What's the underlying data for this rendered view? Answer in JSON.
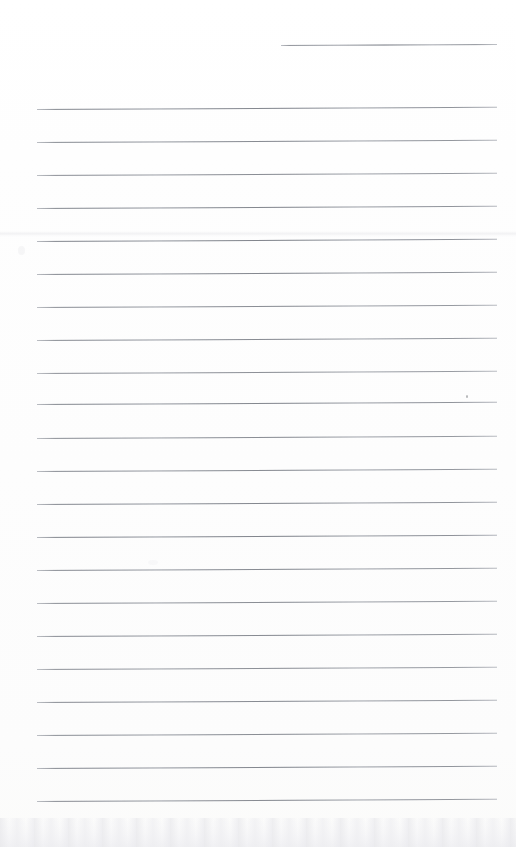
{
  "document": {
    "type": "scanned-blank-lined-page",
    "title": "Blank ruled notebook page",
    "page_width": 516,
    "page_height": 847,
    "background_color": "#fefefe",
    "rule_color": "#b9bcc2",
    "ink_color": "#787a80",
    "text_content": "",
    "has_handwriting": false,
    "has_printed_text": false,
    "rule_count": 24,
    "rule_spacing_px": 33.5,
    "rule_left_margin_px": 37,
    "rule_right_margin_px": 497,
    "skew_degrees": -0.28
  },
  "rules": [
    {
      "index": 1,
      "y": 45,
      "x1": 281,
      "x2": 497,
      "partial": true,
      "weight": 0.85
    },
    {
      "index": 2,
      "y": 109,
      "x1": 37,
      "x2": 497,
      "partial": false,
      "weight": 0.9
    },
    {
      "index": 3,
      "y": 142,
      "x1": 37,
      "x2": 497,
      "partial": false,
      "weight": 0.88
    },
    {
      "index": 4,
      "y": 175,
      "x1": 37,
      "x2": 497,
      "partial": false,
      "weight": 0.86
    },
    {
      "index": 5,
      "y": 208,
      "x1": 37,
      "x2": 497,
      "partial": false,
      "weight": 0.9
    },
    {
      "index": 6,
      "y": 241,
      "x1": 37,
      "x2": 497,
      "partial": false,
      "weight": 0.92
    },
    {
      "index": 7,
      "y": 274,
      "x1": 37,
      "x2": 497,
      "partial": false,
      "weight": 0.9
    },
    {
      "index": 8,
      "y": 307,
      "x1": 37,
      "x2": 497,
      "partial": false,
      "weight": 0.86
    },
    {
      "index": 9,
      "y": 340,
      "x1": 37,
      "x2": 497,
      "partial": false,
      "weight": 0.88
    },
    {
      "index": 10,
      "y": 373,
      "x1": 37,
      "x2": 497,
      "partial": false,
      "weight": 0.84
    },
    {
      "index": 11,
      "y": 404,
      "x1": 37,
      "x2": 497,
      "partial": false,
      "weight": 0.9
    },
    {
      "index": 12,
      "y": 438,
      "x1": 37,
      "x2": 497,
      "partial": false,
      "weight": 0.86
    },
    {
      "index": 13,
      "y": 471,
      "x1": 37,
      "x2": 497,
      "partial": false,
      "weight": 0.88
    },
    {
      "index": 14,
      "y": 504,
      "x1": 37,
      "x2": 497,
      "partial": false,
      "weight": 0.9
    },
    {
      "index": 15,
      "y": 537,
      "x1": 37,
      "x2": 497,
      "partial": false,
      "weight": 0.92
    },
    {
      "index": 16,
      "y": 570,
      "x1": 37,
      "x2": 497,
      "partial": false,
      "weight": 0.88
    },
    {
      "index": 17,
      "y": 603,
      "x1": 37,
      "x2": 497,
      "partial": false,
      "weight": 0.86
    },
    {
      "index": 18,
      "y": 636,
      "x1": 37,
      "x2": 497,
      "partial": false,
      "weight": 0.88
    },
    {
      "index": 19,
      "y": 669,
      "x1": 37,
      "x2": 497,
      "partial": false,
      "weight": 0.84
    },
    {
      "index": 20,
      "y": 702,
      "x1": 37,
      "x2": 497,
      "partial": false,
      "weight": 0.88
    },
    {
      "index": 21,
      "y": 735,
      "x1": 37,
      "x2": 497,
      "partial": false,
      "weight": 0.86
    },
    {
      "index": 22,
      "y": 768,
      "x1": 37,
      "x2": 497,
      "partial": false,
      "weight": 0.9
    },
    {
      "index": 23,
      "y": 801,
      "x1": 37,
      "x2": 497,
      "partial": false,
      "weight": 0.88
    }
  ],
  "artifacts": {
    "scan_band": {
      "y": 231,
      "height": 6,
      "label": "faint horizontal scanner band"
    },
    "bottom_noise": {
      "y": 818,
      "height": 29,
      "label": "bottom edge shadow and speckle"
    },
    "ink_dot": {
      "x": 466,
      "y": 395,
      "label": "small pen dot"
    },
    "blotches": [
      {
        "x": 18,
        "y": 246,
        "w": 7,
        "h": 9,
        "opacity": 0.3
      },
      {
        "x": 148,
        "y": 560,
        "w": 10,
        "h": 5,
        "opacity": 0.18
      }
    ]
  }
}
